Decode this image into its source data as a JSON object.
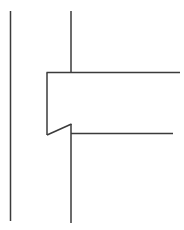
{
  "canvas": {
    "width": 184,
    "height": 230,
    "background_color": "#ffffff",
    "title": "Technical line drawing"
  },
  "style": {
    "stroke_color": "#3b3b3b",
    "stroke_width": 1.5,
    "stroke_width_thin": 1.4
  },
  "chart_data": {
    "type": "line",
    "xlabel": "",
    "ylabel": "",
    "xlim": [
      0,
      184
    ],
    "ylim": [
      0,
      230
    ],
    "grid": false,
    "legend": "none",
    "series": [
      {
        "name": "left-vertical-line",
        "description": "Tall standalone vertical line at far left",
        "points": [
          [
            10.5,
            11
          ],
          [
            10.5,
            221
          ]
        ]
      },
      {
        "name": "center-vertical-top-stub",
        "description": "Upper vertical stub descending to the upper horizontal",
        "points": [
          [
            71,
            11
          ],
          [
            71,
            73
          ]
        ]
      },
      {
        "name": "center-vertical-bottom",
        "description": "Lower vertical continuing from the notch apex to the bottom",
        "points": [
          [
            71,
            124
          ],
          [
            71,
            223
          ]
        ]
      },
      {
        "name": "inner-vertical-line",
        "description": "Short inner vertical forming the left wall of the pocket",
        "points": [
          [
            47,
            72.5
          ],
          [
            47,
            135
          ]
        ]
      },
      {
        "name": "upper-horizontal-line",
        "description": "Long horizontal from the inner corner to the right edge",
        "points": [
          [
            46.5,
            72.5
          ],
          [
            180,
            72.5
          ]
        ]
      },
      {
        "name": "lower-horizontal-line",
        "description": "Lower horizontal running right from the center vertical",
        "points": [
          [
            71,
            133.5
          ],
          [
            173,
            133.5
          ]
        ]
      },
      {
        "name": "diagonal-chamfer-line",
        "description": "Angled chamfer rising from the inner vertical base to the center vertical",
        "points": [
          [
            47,
            135
          ],
          [
            71.5,
            124
          ]
        ]
      }
    ]
  }
}
